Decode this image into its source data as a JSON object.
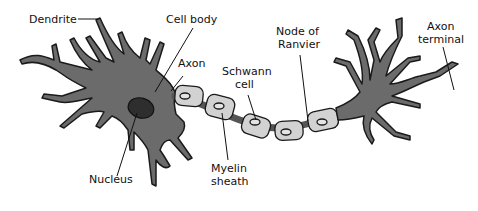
{
  "colors": {
    "neuron_fill": "#6b6b6b",
    "outline": "#1a1a1a",
    "nucleus": "#2e2e2e",
    "schwann_fill": "#d2d2d2",
    "background": "#ffffff"
  },
  "labels": {
    "dendrite": "Dendrite",
    "cell_body": "Cell body",
    "axon": "Axon",
    "schwann_line1": "Schwann",
    "schwann_line2": "cell",
    "node_line1": "Node of",
    "node_line2": "Ranvier",
    "terminal_line1": "Axon",
    "terminal_line2": "terminal",
    "nucleus": "Nucleus",
    "myelin_line1": "Myelin",
    "myelin_line2": "sheath"
  }
}
